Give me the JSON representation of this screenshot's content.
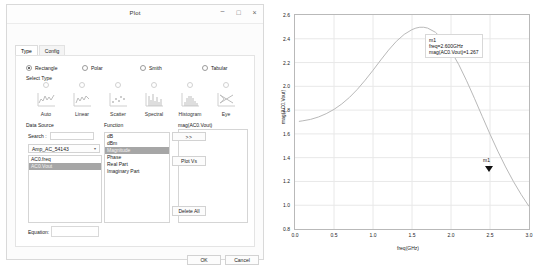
{
  "dialog": {
    "title": "Plot",
    "window_buttons": [
      {
        "name": "minimize",
        "glyph": "–"
      },
      {
        "name": "maximize",
        "glyph": "□"
      },
      {
        "name": "close",
        "glyph": "×"
      }
    ],
    "tabs": [
      {
        "label": "Type",
        "active": true
      },
      {
        "label": "Config",
        "active": false
      }
    ],
    "plot_kind_radios": [
      {
        "label": "Rectangle",
        "selected": true
      },
      {
        "label": "Polar",
        "selected": false
      },
      {
        "label": "Smith",
        "selected": false
      },
      {
        "label": "Tabular",
        "selected": false
      }
    ],
    "select_type_label": "Select Type",
    "type_icons": [
      {
        "label": "Auto",
        "icon": "auto-plot-icon",
        "selected": false
      },
      {
        "label": "Linear",
        "icon": "linear-plot-icon",
        "selected": false
      },
      {
        "label": "Scatter",
        "icon": "scatter-plot-icon",
        "selected": false
      },
      {
        "label": "Spectral",
        "icon": "spectral-plot-icon",
        "selected": false
      },
      {
        "label": "Histogram",
        "icon": "histogram-plot-icon",
        "selected": false
      },
      {
        "label": "Eye",
        "icon": "eye-diagram-icon",
        "selected": false
      }
    ],
    "data_source": {
      "label": "Data Source",
      "search_label": "Search :",
      "search_value": "",
      "search_placeholder": "",
      "dataset_combo_value": "Amp_AC_54143",
      "combo_caret": "▾",
      "signals": [
        {
          "label": "AC0.freq",
          "selected": false
        },
        {
          "label": "AC0.Vout",
          "selected": true
        }
      ]
    },
    "function": {
      "label": "Function",
      "items": [
        {
          "label": "dB",
          "selected": false
        },
        {
          "label": "dBm",
          "selected": false
        },
        {
          "label": "Magnitude",
          "selected": true
        },
        {
          "label": "Phase",
          "selected": false
        },
        {
          "label": "Real Part",
          "selected": false
        },
        {
          "label": "Imaginary Part",
          "selected": false
        }
      ]
    },
    "traces": {
      "label": "mag(AC0.Vout)",
      "items": [
        {
          "label": "mag(AC0.Vout)"
        }
      ]
    },
    "action_buttons": [
      {
        "name": "add-trace-button",
        "label": ">>"
      },
      {
        "name": "plot-vs-button",
        "label": "Plot Vs"
      },
      {
        "name": "delete-all-button",
        "label": "Delete All"
      }
    ],
    "equation": {
      "label": "Equation:",
      "value": "",
      "placeholder": ""
    },
    "footer_buttons": [
      {
        "name": "ok-button",
        "label": "OK"
      },
      {
        "name": "cancel-button",
        "label": "Cancel"
      }
    ]
  },
  "chart_data": {
    "type": "line",
    "title": "",
    "xlabel": "freq(GHz)",
    "ylabel": "mag(AC0.Vout)",
    "xlim": [
      0.0,
      3.0
    ],
    "ylim": [
      0.8,
      2.6
    ],
    "grid": true,
    "legend": "none",
    "xticks": [
      "0.0",
      "0.5",
      "1.0",
      "1.5",
      "2.0",
      "2.5",
      "3.0"
    ],
    "yticks": [
      "0.8",
      "1.0",
      "1.2",
      "1.4",
      "1.6",
      "1.8",
      "2.0",
      "2.2",
      "2.4",
      "2.6"
    ],
    "series": [
      {
        "name": "mag(AC0.Vout)",
        "color": "#b9b9b9",
        "x": [
          0.05,
          0.1,
          0.2,
          0.3,
          0.4,
          0.5,
          0.6,
          0.7,
          0.8,
          0.9,
          1.0,
          1.1,
          1.2,
          1.3,
          1.4,
          1.5,
          1.55,
          1.6,
          1.65,
          1.7,
          1.8,
          1.9,
          2.0,
          2.1,
          2.2,
          2.3,
          2.4,
          2.5,
          2.6,
          2.7,
          2.8,
          2.9,
          3.0
        ],
        "y": [
          1.705,
          1.71,
          1.722,
          1.742,
          1.77,
          1.806,
          1.852,
          1.908,
          1.975,
          2.052,
          2.135,
          2.222,
          2.305,
          2.379,
          2.437,
          2.477,
          2.49,
          2.497,
          2.497,
          2.49,
          2.455,
          2.39,
          2.298,
          2.182,
          2.047,
          1.9,
          1.748,
          1.598,
          1.455,
          1.322,
          1.2,
          1.09,
          0.99
        ]
      }
    ],
    "annotations": [
      {
        "name": "m1",
        "marker_label": "m1",
        "freq": "freq=2.600GHz",
        "value": "mag(AC0.Vout)=1.267",
        "x": 2.6,
        "y": 1.267
      }
    ]
  }
}
